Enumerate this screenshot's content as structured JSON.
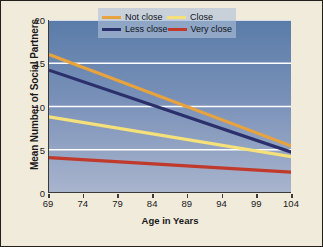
{
  "chart_data": {
    "type": "line",
    "title": "",
    "xlabel": "Age in Years",
    "ylabel": "Mean Number of Social Partners",
    "xlim": [
      69,
      104
    ],
    "ylim": [
      0,
      20
    ],
    "xticks": [
      69,
      74,
      79,
      84,
      89,
      94,
      99,
      104
    ],
    "yticks": [
      0,
      5,
      10,
      15,
      20
    ],
    "grid": "horizontal",
    "gridlines": [
      5,
      10,
      15,
      20
    ],
    "gridline_color": "#ffffff",
    "legend_position": "top-right-inside",
    "plot_background": "blue-vertical-gradient",
    "figure_background": "#f1ebdc",
    "x": [
      69,
      104
    ],
    "series": [
      {
        "name": "Not close",
        "color": "#e8a33d",
        "values": [
          16.0,
          5.4
        ]
      },
      {
        "name": "Close",
        "color": "#f5e07a",
        "values": [
          8.8,
          4.2
        ]
      },
      {
        "name": "Less close",
        "color": "#2b2f6b",
        "values": [
          14.2,
          4.7
        ]
      },
      {
        "name": "Very close",
        "color": "#c0392b",
        "values": [
          4.1,
          2.4
        ]
      }
    ]
  },
  "legend": {
    "rows": [
      [
        {
          "label": "Not close",
          "color": "#e8a33d"
        },
        {
          "label": "Close",
          "color": "#f5e07a"
        }
      ],
      [
        {
          "label": "Less close",
          "color": "#2b2f6b"
        },
        {
          "label": "Very close",
          "color": "#c0392b"
        }
      ]
    ]
  }
}
